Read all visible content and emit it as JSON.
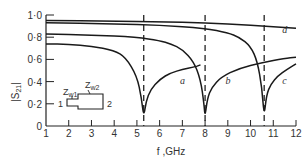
{
  "chart_data": {
    "type": "line",
    "title": "",
    "xlabel": "f ,GHz",
    "ylabel": "|S21|",
    "xlim": [
      1,
      12
    ],
    "ylim": [
      0,
      1.0
    ],
    "x_ticks": [
      1,
      2,
      3,
      4,
      5,
      6,
      7,
      8,
      9,
      10,
      11,
      12
    ],
    "y_ticks": [
      0,
      0.2,
      0.4,
      0.6,
      0.8,
      1.0
    ],
    "y_tick_labels": [
      "0",
      "0·2",
      "0·4",
      "0·6",
      "0·8",
      "1·0"
    ],
    "grid": false,
    "legend": "inline curve labels",
    "resonances_ghz": [
      5.3,
      8.0,
      10.6
    ],
    "series": [
      {
        "name": "a",
        "x": [
          1,
          2,
          3,
          4,
          4.5,
          5.0,
          5.2,
          5.3,
          5.4,
          5.6,
          6.0,
          6.5,
          7.0,
          7.5,
          7.8
        ],
        "y": [
          0.74,
          0.735,
          0.72,
          0.68,
          0.62,
          0.45,
          0.25,
          0.08,
          0.22,
          0.33,
          0.42,
          0.48,
          0.51,
          0.53,
          0.55
        ]
      },
      {
        "name": "b",
        "x": [
          1,
          3,
          5,
          6,
          6.5,
          7.0,
          7.5,
          7.8,
          7.95,
          8.0,
          8.1,
          8.3,
          8.7,
          9.5,
          10.5,
          11.5,
          12
        ],
        "y": [
          0.83,
          0.82,
          0.8,
          0.77,
          0.74,
          0.69,
          0.58,
          0.42,
          0.2,
          0.08,
          0.25,
          0.35,
          0.44,
          0.52,
          0.57,
          0.61,
          0.62
        ]
      },
      {
        "name": "c",
        "x": [
          1,
          4,
          6,
          8,
          9,
          9.5,
          10.0,
          10.3,
          10.5,
          10.6,
          10.7,
          10.9,
          11.2,
          11.6,
          12
        ],
        "y": [
          0.93,
          0.92,
          0.91,
          0.88,
          0.84,
          0.8,
          0.72,
          0.58,
          0.35,
          0.08,
          0.28,
          0.38,
          0.45,
          0.51,
          0.56
        ]
      },
      {
        "name": "d",
        "x": [
          1,
          4,
          6,
          8,
          10,
          12
        ],
        "y": [
          0.95,
          0.945,
          0.94,
          0.93,
          0.91,
          0.88
        ]
      }
    ],
    "annotations": {
      "curve_labels": [
        "a",
        "b",
        "c",
        "d"
      ],
      "inset": {
        "description": "stepped-impedance line schematic",
        "port_in": "1",
        "port_out": "2",
        "section1": "Z",
        "section1_sub": "w1",
        "section2": "Z",
        "section2_sub": "w2"
      }
    }
  }
}
